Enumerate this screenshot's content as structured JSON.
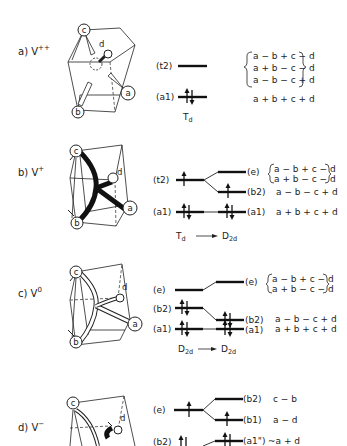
{
  "panels": [
    {
      "label": "a) V",
      "charge": "++",
      "atoms": [
        "c",
        "d",
        "a",
        "b"
      ],
      "symmetry": "Td",
      "levels_left": [
        "(t2)",
        "(a1)"
      ],
      "orbitals": [
        "a − b + c − d",
        "a + b − c − d",
        "a − b − c + d",
        "a + b + c + d"
      ]
    },
    {
      "label": "b) V",
      "charge": "+",
      "atoms": [
        "c",
        "d",
        "a",
        "b"
      ],
      "symmetry_from": "Td",
      "symmetry_to": "D2d",
      "levels_left": [
        "(t2)",
        "(a1)"
      ],
      "levels_right": [
        "(e)",
        "(b2)",
        "(a1)"
      ],
      "orbitals": [
        "a − b + c − d",
        "a + b − c − d",
        "a − b − c + d",
        "a + b + c + d"
      ]
    },
    {
      "label": "c) V",
      "charge": "0",
      "atoms": [
        "c",
        "d",
        "a",
        "b"
      ],
      "symmetry_from": "D2d",
      "symmetry_to": "D2d",
      "levels_left": [
        "(e)",
        "(b2)",
        "(a1)"
      ],
      "levels_right": [
        "(e)",
        "(b2)",
        "(a1)"
      ],
      "orbitals": [
        "a − b + c − d",
        "a + b − c − d",
        "a − b − c + d",
        "a + b + c + d"
      ]
    },
    {
      "label": "d) V",
      "charge": "−",
      "atoms": [
        "c",
        "d"
      ],
      "levels_left": [
        "(e)",
        "(b2)"
      ],
      "levels_right": [
        "(b2)",
        "(b1)",
        "(a1\")"
      ],
      "orbitals": [
        "c − b",
        "a − d",
        "~a + d"
      ]
    }
  ],
  "arrow": "→"
}
